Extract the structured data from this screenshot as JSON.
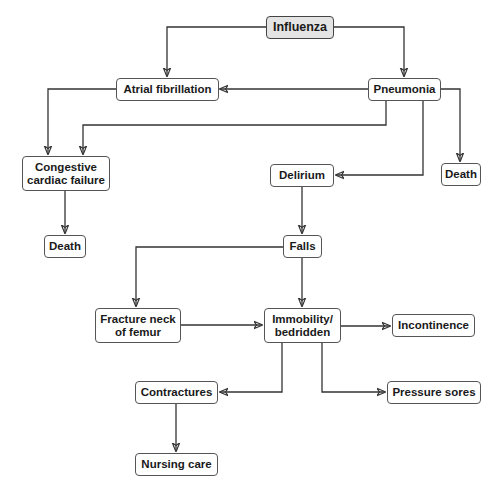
{
  "diagram": {
    "type": "flowchart",
    "nodes": {
      "influenza": {
        "label": "Influenza",
        "fill": "#e4e4e4"
      },
      "atrial_fibrillation": {
        "label": "Atrial fibrillation"
      },
      "pneumonia": {
        "label": "Pneumonia"
      },
      "congestive_cardiac_failure": {
        "label": "Congestive cardiac failure"
      },
      "delirium": {
        "label": "Delirium"
      },
      "death_pneumonia": {
        "label": "Death"
      },
      "death_ccf": {
        "label": "Death"
      },
      "falls": {
        "label": "Falls"
      },
      "fracture_neck_of_femur": {
        "label": "Fracture neck of femur"
      },
      "immobility": {
        "label": "Immobility/ bedridden"
      },
      "incontinence": {
        "label": "Incontinence"
      },
      "contractures": {
        "label": "Contractures"
      },
      "pressure_sores": {
        "label": "Pressure sores"
      },
      "nursing_care": {
        "label": "Nursing care"
      }
    },
    "edges": [
      {
        "from": "Influenza",
        "to": "Atrial fibrillation"
      },
      {
        "from": "Influenza",
        "to": "Pneumonia"
      },
      {
        "from": "Pneumonia",
        "to": "Atrial fibrillation"
      },
      {
        "from": "Atrial fibrillation",
        "to": "Congestive cardiac failure"
      },
      {
        "from": "Pneumonia",
        "to": "Congestive cardiac failure"
      },
      {
        "from": "Pneumonia",
        "to": "Delirium"
      },
      {
        "from": "Pneumonia",
        "to": "Death"
      },
      {
        "from": "Congestive cardiac failure",
        "to": "Death"
      },
      {
        "from": "Delirium",
        "to": "Falls"
      },
      {
        "from": "Falls",
        "to": "Fracture neck of femur"
      },
      {
        "from": "Falls",
        "to": "Immobility/ bedridden"
      },
      {
        "from": "Fracture neck of femur",
        "to": "Immobility/ bedridden"
      },
      {
        "from": "Immobility/ bedridden",
        "to": "Incontinence"
      },
      {
        "from": "Immobility/ bedridden",
        "to": "Contractures"
      },
      {
        "from": "Immobility/ bedridden",
        "to": "Pressure sores"
      },
      {
        "from": "Contractures",
        "to": "Nursing care"
      }
    ],
    "colors": {
      "line": "#333333",
      "border": "#555555",
      "root_fill": "#e4e4e4"
    }
  }
}
